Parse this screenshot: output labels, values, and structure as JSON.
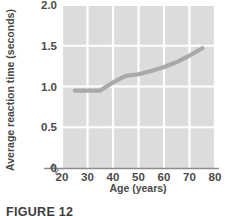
{
  "figure": {
    "caption": "FIGURE 12",
    "colors": {
      "panel_background": "#dcdcdc",
      "gridline": "#ffffff",
      "line_series": "#a9a9a9",
      "axis": "#8c8c8c",
      "text": "#4a4a4a"
    }
  },
  "chart_data": {
    "type": "line",
    "title": "",
    "xlabel": "Age (years)",
    "ylabel": "Average reaction time (seconds)",
    "xlim": [
      20,
      80
    ],
    "ylim": [
      0,
      2.0
    ],
    "xticks": [
      20,
      30,
      40,
      50,
      60,
      70,
      80
    ],
    "xtick_labels": [
      "20",
      "30",
      "40",
      "50",
      "60",
      "70",
      "80"
    ],
    "yticks": [
      0,
      0.5,
      1.0,
      1.5,
      2.0
    ],
    "ytick_labels": [
      "0",
      "0.5",
      "1.0",
      "1.5",
      "2.0"
    ],
    "grid": true,
    "legend": false,
    "axis_break": true,
    "axis_break_note": "zigzag break on x-axis between 0 and 20",
    "series": [
      {
        "name": "Average reaction time",
        "x": [
          25,
          30,
          35,
          40,
          45,
          50,
          55,
          60,
          65,
          70,
          75
        ],
        "values": [
          0.95,
          0.95,
          0.95,
          1.05,
          1.13,
          1.15,
          1.19,
          1.24,
          1.3,
          1.38,
          1.47
        ]
      }
    ]
  }
}
